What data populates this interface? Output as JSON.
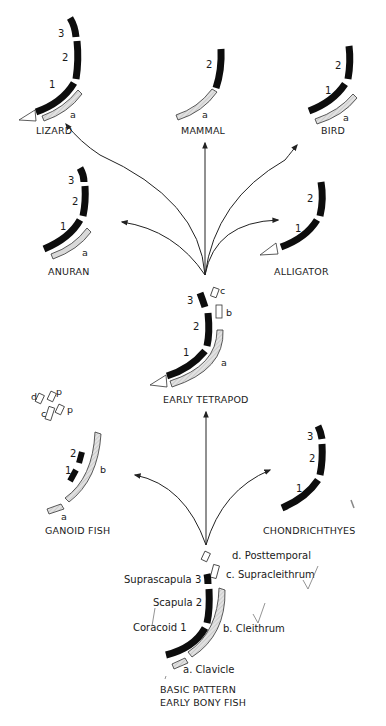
{
  "diagram": {
    "colors": {
      "endochondral_bone": "#0d0d0d",
      "dermal_bone_fill": "#d9d9d9",
      "outline": "#333333",
      "background": "#ffffff"
    },
    "nodes": {
      "lizard": {
        "label": "LIZARD",
        "bones": [
          "3",
          "2",
          "1",
          "a"
        ]
      },
      "mammal": {
        "label": "MAMMAL",
        "bones": [
          "2",
          "a"
        ]
      },
      "bird": {
        "label": "BIRD",
        "bones": [
          "2",
          "1",
          "a"
        ]
      },
      "anuran": {
        "label": "ANURAN",
        "bones": [
          "3",
          "2",
          "1",
          "a"
        ]
      },
      "alligator": {
        "label": "ALLIGATOR",
        "bones": [
          "2",
          "1"
        ]
      },
      "early_tetrapod": {
        "label": "EARLY TETRAPOD",
        "bones": [
          "3",
          "2",
          "1",
          "c",
          "b",
          "a"
        ]
      },
      "ganoid_fish": {
        "label": "GANOID FISH",
        "bones": [
          "d",
          "p",
          "c",
          "p",
          "2",
          "1",
          "b",
          "a"
        ]
      },
      "chondrichthyes": {
        "label": "CHONDRICHTHYES",
        "bones": [
          "3",
          "2",
          "1"
        ]
      },
      "basic_pattern": {
        "label_line1": "BASIC PATTERN",
        "label_line2": "EARLY BONY FISH",
        "endochondral": [
          {
            "num": "3",
            "name": "Suprascapula"
          },
          {
            "num": "2",
            "name": "Scapula"
          },
          {
            "num": "1",
            "name": "Coracoid"
          }
        ],
        "dermal": [
          {
            "letter": "d.",
            "name": "Posttemporal"
          },
          {
            "letter": "c.",
            "name": "Supracleithrum"
          },
          {
            "letter": "b.",
            "name": "Cleithrum"
          },
          {
            "letter": "a.",
            "name": "Clavicle"
          }
        ]
      }
    },
    "glyphs": {
      "n1": "1",
      "n2": "2",
      "n3": "3",
      "a": "a",
      "b": "b",
      "c": "c",
      "d": "d",
      "p": "p"
    },
    "edges": [
      {
        "from": "basic_pattern",
        "to": "ganoid_fish"
      },
      {
        "from": "basic_pattern",
        "to": "early_tetrapod"
      },
      {
        "from": "basic_pattern",
        "to": "chondrichthyes"
      },
      {
        "from": "early_tetrapod",
        "to": "lizard"
      },
      {
        "from": "early_tetrapod",
        "to": "mammal"
      },
      {
        "from": "early_tetrapod",
        "to": "bird"
      },
      {
        "from": "early_tetrapod",
        "to": "anuran"
      },
      {
        "from": "early_tetrapod",
        "to": "alligator"
      }
    ]
  }
}
